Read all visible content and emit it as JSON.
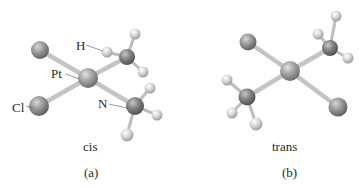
{
  "figure": {
    "panels": [
      {
        "id": "a",
        "isomer_label": "cis",
        "panel_label": "(a)",
        "atom_labels": {
          "hydrogen": "H",
          "platinum": "Pt",
          "chlorine": "Cl",
          "nitrogen": "N"
        }
      },
      {
        "id": "b",
        "isomer_label": "trans",
        "panel_label": "(b)"
      }
    ],
    "colors": {
      "background": "#ffffff",
      "chlorine": "#8f8f8f",
      "platinum": "#9a9a9a",
      "nitrogen": "#7c7c7c",
      "hydrogen": "#d4d4d4",
      "bond": "#c9c9c9",
      "text": "#2a2a2a"
    }
  }
}
